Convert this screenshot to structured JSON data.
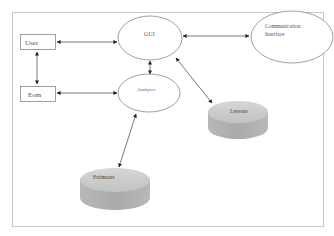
{
  "diagram": {
    "type": "system-architecture",
    "nodes": [
      {
        "id": "user",
        "label": "User",
        "shape": "rectangle"
      },
      {
        "id": "eom",
        "label": "Eom",
        "shape": "rectangle"
      },
      {
        "id": "gui",
        "label": "GUI",
        "shape": "ellipse"
      },
      {
        "id": "analyzer",
        "label": "Analyzer",
        "shape": "ellipse"
      },
      {
        "id": "comm",
        "label_line1": "Communication",
        "label_line2": "Interface",
        "shape": "ellipse"
      },
      {
        "id": "lessons",
        "label": "Lessons",
        "shape": "database"
      },
      {
        "id": "estimates",
        "label": "Estimates",
        "shape": "database"
      }
    ],
    "edges": [
      {
        "from": "user",
        "to": "gui",
        "direction": "bidirectional"
      },
      {
        "from": "user",
        "to": "eom",
        "direction": "bidirectional"
      },
      {
        "from": "eom",
        "to": "analyzer",
        "direction": "bidirectional"
      },
      {
        "from": "gui",
        "to": "analyzer",
        "direction": "bidirectional"
      },
      {
        "from": "gui",
        "to": "comm",
        "direction": "bidirectional"
      },
      {
        "from": "gui",
        "to": "lessons",
        "direction": "bidirectional"
      },
      {
        "from": "analyzer",
        "to": "estimates",
        "direction": "bidirectional"
      }
    ]
  },
  "colors": {
    "frame": "#c8c8c8",
    "stroke": "#888888",
    "arrow": "#333333",
    "db_top": "#c9c9c9",
    "db_side": "#b0b0b0",
    "text": "#555555"
  }
}
